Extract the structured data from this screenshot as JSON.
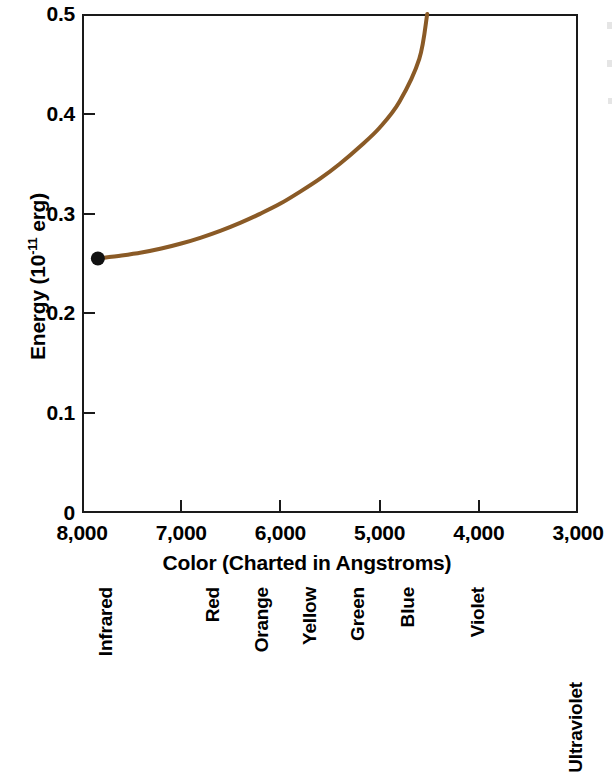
{
  "chart_data": {
    "type": "line",
    "title": "",
    "xlabel": "Color (Charted in Angstroms)",
    "ylabel": "Energy (10⁻¹¹ erg)",
    "ylabel_base": "Energy (10",
    "ylabel_exponent": "-11",
    "ylabel_tail": " erg)",
    "xlim": [
      8000,
      3000
    ],
    "ylim": [
      0,
      0.5
    ],
    "x_ticks": [
      8000,
      7000,
      6000,
      5000,
      4000,
      3000
    ],
    "x_tick_labels": [
      "8,000",
      "7,000",
      "6,000",
      "5,000",
      "4,000",
      "3,000"
    ],
    "y_ticks": [
      0,
      0.1,
      0.2,
      0.3,
      0.4,
      0.5
    ],
    "y_tick_labels": [
      "0",
      "0.1",
      "0.2",
      "0.3",
      "0.4",
      "0.5"
    ],
    "grid": false,
    "legend": "none",
    "series": [
      {
        "name": "Energy vs wavelength",
        "color": "#8a5a26",
        "linewidth": 4,
        "start_marker": {
          "shape": "circle",
          "color": "#111111",
          "x": 7840,
          "y": 0.255
        },
        "x": [
          7840,
          7600,
          7400,
          7200,
          7000,
          6800,
          6600,
          6400,
          6200,
          6000,
          5800,
          5600,
          5400,
          5200,
          5000,
          4800,
          4600,
          4520
        ],
        "y": [
          0.255,
          0.258,
          0.261,
          0.265,
          0.27,
          0.276,
          0.283,
          0.291,
          0.3,
          0.31,
          0.322,
          0.335,
          0.35,
          0.367,
          0.386,
          0.412,
          0.455,
          0.5
        ]
      }
    ],
    "color_bands": [
      {
        "label": "Infrared",
        "x_px": 86,
        "baseline": "top"
      },
      {
        "label": "Red",
        "x_px": 193,
        "baseline": "top"
      },
      {
        "label": "Orange",
        "x_px": 242,
        "baseline": "top"
      },
      {
        "label": "Yellow",
        "x_px": 290,
        "baseline": "top"
      },
      {
        "label": "Green",
        "x_px": 338,
        "baseline": "top"
      },
      {
        "label": "Blue",
        "x_px": 388,
        "baseline": "top"
      },
      {
        "label": "Violet",
        "x_px": 458,
        "baseline": "top"
      },
      {
        "label": "Ultraviolet",
        "x_px": 556,
        "baseline": "bottom"
      }
    ]
  }
}
